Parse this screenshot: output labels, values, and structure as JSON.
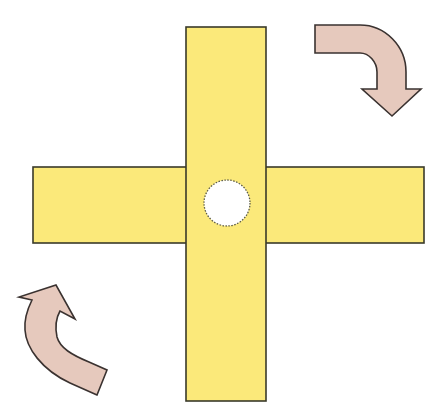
{
  "diagram": {
    "title": "Rotating cross with pivot and clockwise rotation arrows",
    "colors": {
      "background": "#ffffff",
      "bar_fill": "#fbe97a",
      "bar_stroke": "#3a3a2a",
      "pivot_fill": "#ffffff",
      "pivot_stroke": "#5a5a4a",
      "arrow_fill": "#e6c9bd",
      "arrow_stroke": "#3a3230"
    },
    "vertical_bar": {
      "x": 186,
      "y": 27,
      "width": 80,
      "height": 374
    },
    "horizontal_bar": {
      "x": 33,
      "y": 167,
      "width": 391,
      "height": 76
    },
    "pivot": {
      "cx": 227,
      "cy": 203,
      "r": 23
    },
    "arrows": [
      {
        "name": "top-right",
        "direction": "clockwise"
      },
      {
        "name": "bottom-left",
        "direction": "clockwise"
      }
    ]
  }
}
